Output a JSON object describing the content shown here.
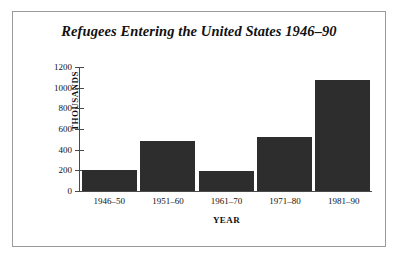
{
  "chart_data": {
    "type": "bar",
    "title": "Refugees Entering the United States 1946–90",
    "xlabel": "YEAR",
    "ylabel": "THOUSANDS",
    "categories": [
      "1946–50",
      "1951–60",
      "1961–70",
      "1971–80",
      "1981–90"
    ],
    "values": [
      205,
      480,
      195,
      525,
      1075
    ],
    "ylim": [
      0,
      1200
    ],
    "yticks": [
      0,
      200,
      400,
      600,
      800,
      1000,
      1200
    ],
    "ytick_labels": [
      "0",
      "200",
      "400",
      "600",
      "800",
      "1000",
      "1200"
    ],
    "grid": false,
    "legend": false,
    "bar_color": "#2d2d2d",
    "frame_color": "#9a9a9a",
    "axis_color": "#4a4a4a",
    "background": "#ffffff"
  }
}
